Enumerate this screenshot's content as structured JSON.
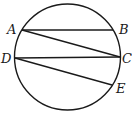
{
  "diagram": {
    "type": "geometry",
    "circle": {
      "cx": 67.5,
      "cy": 57,
      "r": 53
    },
    "points": [
      {
        "name": "A",
        "x": 22,
        "y": 30,
        "label_x": 7,
        "label_y": 34
      },
      {
        "name": "B",
        "x": 113,
        "y": 30,
        "label_x": 119,
        "label_y": 34
      },
      {
        "name": "C",
        "x": 120,
        "y": 57,
        "label_x": 122,
        "label_y": 63
      },
      {
        "name": "D",
        "x": 15,
        "y": 58,
        "label_x": 1,
        "label_y": 63
      },
      {
        "name": "E",
        "x": 112,
        "y": 85,
        "label_x": 116,
        "label_y": 93
      }
    ],
    "chords": [
      {
        "from": "A",
        "to": "B"
      },
      {
        "from": "A",
        "to": "C"
      },
      {
        "from": "D",
        "to": "C"
      },
      {
        "from": "D",
        "to": "E"
      }
    ],
    "labels": {
      "A": "A",
      "B": "B",
      "C": "C",
      "D": "D",
      "E": "E"
    },
    "stroke_color": "#1a1a1a"
  }
}
